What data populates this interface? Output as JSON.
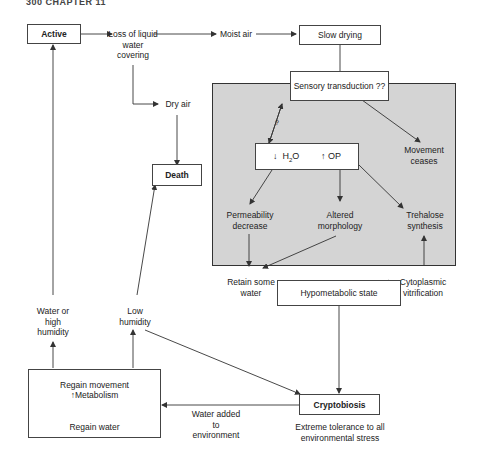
{
  "header": {
    "text": "300 CHAPTER 11"
  },
  "nodes": {
    "active": "Active",
    "loss": "Loss of liquid water covering",
    "moist_air": "Moist air",
    "slow_drying": "Slow drying",
    "sensory": "Sensory transduction ??",
    "dry_air": "Dry air",
    "death": "Death",
    "question": "?",
    "h2o_down": "H",
    "h2o_sub": "2",
    "h2o_o": "O",
    "op_up": "OP",
    "movement_ceases": "Movement ceases",
    "permeability": "Permeability decrease",
    "altered": "Altered morphology",
    "trehalose": "Trehalose synthesis",
    "retain": "Retain some water",
    "vitrification": "Cytoplasmic vitrification",
    "hypometabolic": "Hypometabolic state",
    "water_high": "Water or high humidity",
    "low_humidity": "Low humidity",
    "regain_movement": "Regain movement",
    "metabolism": "Metabolism",
    "regain_water": "Regain water",
    "water_added": "Water added to environment",
    "cryptobiosis": "Cryptobiosis",
    "tolerance": "Extreme tolerance to all environmental stress"
  },
  "icons": {
    "down_arrow": "↓",
    "up_arrow": "↑"
  },
  "colors": {
    "panel": "#d4d4d4",
    "line": "#333333"
  }
}
